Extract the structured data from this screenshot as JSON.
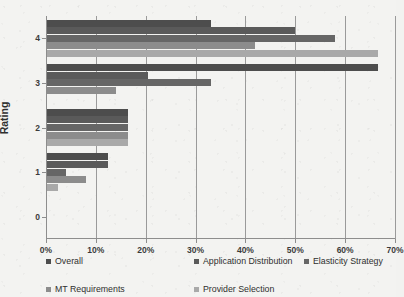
{
  "chart_data": {
    "type": "bar",
    "orientation": "horizontal",
    "title": "",
    "xlabel": "",
    "ylabel": "Rating",
    "categories": [
      "0",
      "1",
      "2",
      "3",
      "4"
    ],
    "xlim": [
      0,
      70
    ],
    "xticks": [
      0,
      10,
      20,
      30,
      40,
      50,
      60,
      70
    ],
    "xtick_labels": [
      "0%",
      "10%",
      "20%",
      "30%",
      "40%",
      "50%",
      "60%",
      "70%"
    ],
    "ytick_labels": [
      "0",
      "1",
      "2",
      "3",
      "4"
    ],
    "grid": "vertical",
    "legend_position": "bottom",
    "value_suffix": "%",
    "series": [
      {
        "name": "Overall",
        "color": "#4d4d4d",
        "values": [
          0,
          12.5,
          16.5,
          66.5,
          33.0
        ]
      },
      {
        "name": "Application Distribution",
        "color": "#5a5a5a",
        "values": [
          0,
          12.5,
          16.5,
          20.5,
          50.0
        ]
      },
      {
        "name": "Elasticity Strategy",
        "color": "#666666",
        "values": [
          0,
          4.0,
          16.5,
          33.0,
          58.0
        ]
      },
      {
        "name": "MT Requirements",
        "color": "#8c8c8c",
        "values": [
          0,
          8.0,
          16.5,
          14.0,
          42.0
        ]
      },
      {
        "name": "Provider Selection",
        "color": "#a9a9a9",
        "values": [
          0,
          2.5,
          16.5,
          0.0,
          66.5
        ]
      }
    ]
  },
  "axes": {
    "y_title": "Rating"
  },
  "legend": {
    "rows": [
      [
        "Overall",
        "Application Distribution",
        "Elasticity Strategy"
      ],
      [
        "MT Requirements",
        "Provider Selection"
      ]
    ]
  }
}
